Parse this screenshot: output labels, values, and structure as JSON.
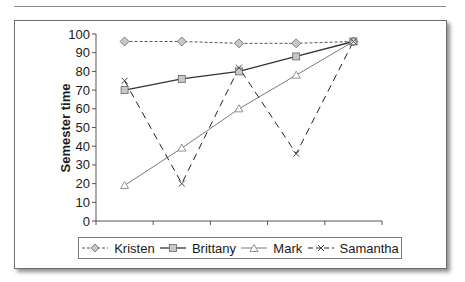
{
  "chart_data": {
    "type": "line",
    "title": "",
    "xlabel": "",
    "ylabel": "Semester time",
    "ylim": [
      0,
      100
    ],
    "yticks": [
      0,
      10,
      20,
      30,
      40,
      50,
      60,
      70,
      80,
      90,
      100
    ],
    "x": [
      1,
      2,
      3,
      4,
      5
    ],
    "grid": false,
    "legend_position": "bottom",
    "series": [
      {
        "name": "Kristen",
        "values": [
          96,
          96,
          95,
          95,
          96
        ],
        "marker": "diamond",
        "line": "short-dash",
        "color": "#555555"
      },
      {
        "name": "Brittany",
        "values": [
          70,
          76,
          80,
          88,
          96
        ],
        "marker": "square",
        "line": "solid",
        "color": "#333333"
      },
      {
        "name": "Mark",
        "values": [
          19,
          39,
          60,
          78,
          96
        ],
        "marker": "triangle",
        "line": "solid-thin",
        "color": "#7a7a7a"
      },
      {
        "name": "Samantha",
        "values": [
          75,
          20,
          82,
          36,
          96
        ],
        "marker": "x",
        "line": "long-dash",
        "color": "#222222"
      }
    ]
  },
  "axis": {
    "y_title": "Semester time",
    "y_ticks": [
      "0",
      "10",
      "20",
      "30",
      "40",
      "50",
      "60",
      "70",
      "80",
      "90",
      "100"
    ]
  },
  "legend": {
    "items": [
      {
        "label": "Kristen"
      },
      {
        "label": "Brittany"
      },
      {
        "label": "Mark"
      },
      {
        "label": "Samantha"
      }
    ]
  }
}
